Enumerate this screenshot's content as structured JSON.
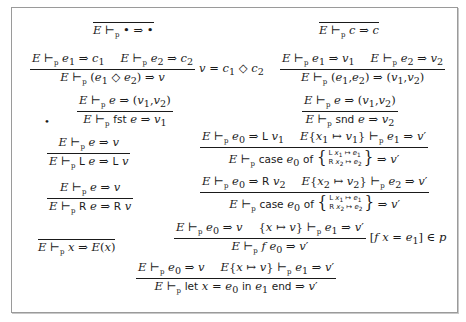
{
  "diagram": {
    "judgment_symbol": "⊢",
    "program_subscript": "p",
    "rules": [
      {
        "id": "unit",
        "premises": [],
        "conclusion": "E ⊢p • ⇒ •",
        "side_condition": ""
      },
      {
        "id": "const",
        "premises": [],
        "conclusion": "E ⊢p c ⇒ c",
        "side_condition": ""
      },
      {
        "id": "binop",
        "premises": [
          "E ⊢p e1 ⇒ c1",
          "E ⊢p e2 ⇒ c2"
        ],
        "conclusion": "E ⊢p (e1 ◇ e2) ⇒ v",
        "side_condition": "v = c1 ◇ c2"
      },
      {
        "id": "pair",
        "premises": [
          "E ⊢p e1 ⇒ v1",
          "E ⊢p e2 ⇒ v2"
        ],
        "conclusion": "E ⊢p (e1,e2) ⇒ (v1,v2)",
        "side_condition": ""
      },
      {
        "id": "fst",
        "premises": [
          "E ⊢p e ⇒ (v1,v2)"
        ],
        "conclusion": "E ⊢p fst e ⇒ v1",
        "side_condition": "",
        "marker": "•"
      },
      {
        "id": "snd",
        "premises": [
          "E ⊢p e ⇒ (v1,v2)"
        ],
        "conclusion": "E ⊢p snd e ⇒ v2",
        "side_condition": ""
      },
      {
        "id": "inl",
        "premises": [
          "E ⊢p e ⇒ v"
        ],
        "conclusion": "E ⊢p L e ⇒ L v",
        "side_condition": ""
      },
      {
        "id": "case-l",
        "premises": [
          "E ⊢p e0 ⇒ L v1",
          "E{x1 ↦ v1} ⊢p e1 ⇒ v'"
        ],
        "conclusion": "E ⊢p case e0 of { L x1 ↦ e1 ; R x2 ↦ e2 } ⇒ v'",
        "side_condition": ""
      },
      {
        "id": "inr",
        "premises": [
          "E ⊢p e ⇒ v"
        ],
        "conclusion": "E ⊢p R e ⇒ R v",
        "side_condition": ""
      },
      {
        "id": "case-r",
        "premises": [
          "E ⊢p e0 ⇒ R v2",
          "E{x2 ↦ v2} ⊢p e2 ⇒ v'"
        ],
        "conclusion": "E ⊢p case e0 of { L x1 ↦ e1 ; R x2 ↦ e2 } ⇒ v'",
        "side_condition": ""
      },
      {
        "id": "var",
        "premises": [],
        "conclusion": "E ⊢p x ⇒ E(x)",
        "side_condition": ""
      },
      {
        "id": "app",
        "premises": [
          "E ⊢p e0 ⇒ v",
          "{x ↦ v} ⊢p e1 ⇒ v'"
        ],
        "conclusion": "E ⊢p f e0 ⇒ v'",
        "side_condition": "[f x = e1] ∈ p"
      },
      {
        "id": "let",
        "premises": [
          "E ⊢p e0 ⇒ v",
          "E{x ↦ v} ⊢p e1 ⇒ v'"
        ],
        "conclusion": "E ⊢p let x = e0 in e1 end ⇒ v'",
        "side_condition": ""
      }
    ]
  }
}
